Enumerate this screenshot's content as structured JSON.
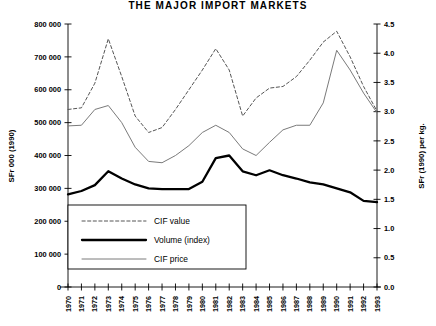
{
  "chart_data": {
    "type": "line",
    "title": "THE MAJOR IMPORT MARKETS",
    "xlabel": "",
    "ylabel": "SFr 000 (1990)",
    "ylabel_right": "SFr (1990) per kg.",
    "grid": false,
    "legend_position": "inside-lower-left",
    "x": [
      1970,
      1971,
      1972,
      1973,
      1974,
      1975,
      1976,
      1977,
      1978,
      1979,
      1980,
      1981,
      1982,
      1983,
      1984,
      1985,
      1986,
      1987,
      1988,
      1989,
      1990,
      1991,
      1992,
      1993
    ],
    "categories": [
      "1970",
      "1971",
      "1972",
      "1973",
      "1974",
      "1975",
      "1976",
      "1977",
      "1978",
      "1979",
      "1980",
      "1981",
      "1982",
      "1983",
      "1984",
      "1985",
      "1986",
      "1987",
      "1988",
      "1989",
      "1990",
      "1991",
      "1992",
      "1993"
    ],
    "ylim": [
      0,
      800000
    ],
    "yticks": [
      0,
      100000,
      200000,
      300000,
      400000,
      500000,
      600000,
      700000,
      800000
    ],
    "ytick_labels": [
      "0",
      "100 000",
      "200 000",
      "300 000",
      "400 000",
      "500 000",
      "600 000",
      "700 000",
      "800 000"
    ],
    "ylim_right": [
      0.0,
      4.5
    ],
    "yticks_right": [
      0.0,
      0.5,
      1.0,
      1.5,
      2.0,
      2.5,
      3.0,
      3.5,
      4.0,
      4.5
    ],
    "ytick_labels_right": [
      "0.0",
      "0.5",
      "1.0",
      "1.5",
      "2.0",
      "2.5",
      "3.0",
      "3.5",
      "4.0",
      "4.5"
    ],
    "series": [
      {
        "name": "CIF value",
        "axis": "left",
        "style": "dashed",
        "color": "#555555",
        "width": 1.0,
        "values": [
          540000,
          545000,
          620000,
          755000,
          640000,
          520000,
          470000,
          485000,
          540000,
          600000,
          660000,
          725000,
          660000,
          520000,
          575000,
          605000,
          610000,
          640000,
          690000,
          745000,
          778000,
          700000,
          610000,
          535000
        ]
      },
      {
        "name": "Volume (index)",
        "axis": "left",
        "style": "solid",
        "color": "#000000",
        "width": 2.3,
        "values": [
          282000,
          292000,
          310000,
          352000,
          330000,
          312000,
          300000,
          298000,
          298000,
          298000,
          320000,
          392000,
          400000,
          352000,
          340000,
          355000,
          340000,
          330000,
          318000,
          312000,
          300000,
          288000,
          262000,
          258000
        ]
      },
      {
        "name": "CIF price",
        "axis": "left",
        "style": "solid",
        "color": "#7a7a7a",
        "width": 1.0,
        "values": [
          490000,
          492000,
          540000,
          552000,
          500000,
          425000,
          382000,
          378000,
          400000,
          430000,
          470000,
          492000,
          470000,
          420000,
          400000,
          440000,
          478000,
          492000,
          492000,
          560000,
          720000,
          660000,
          590000,
          530000
        ]
      }
    ],
    "legend_entries": [
      {
        "label": "CIF value",
        "style": "dashed",
        "color": "#555555",
        "width": 1.0
      },
      {
        "label": "Volume (index)",
        "style": "solid",
        "color": "#000000",
        "width": 2.3
      },
      {
        "label": "CIF price",
        "style": "solid",
        "color": "#7a7a7a",
        "width": 1.0
      }
    ]
  }
}
